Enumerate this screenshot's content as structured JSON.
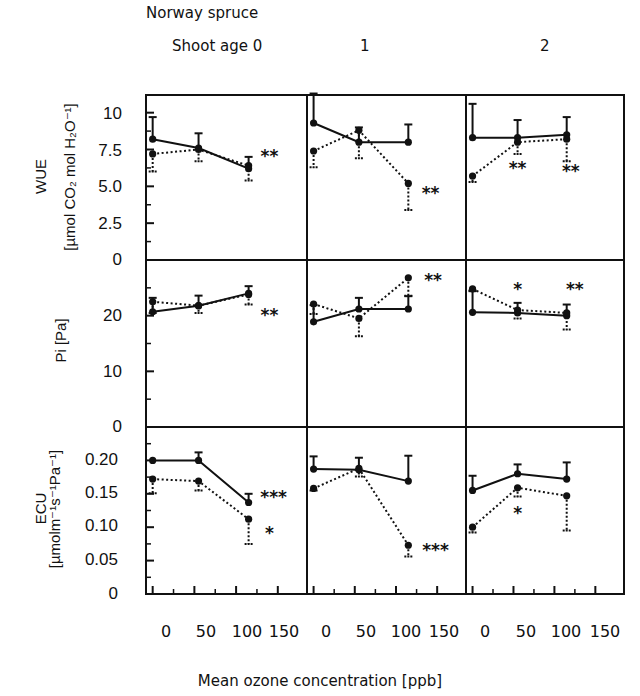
{
  "figure": {
    "species": "Norway spruce",
    "age_labels": [
      "Shoot age 0",
      "1",
      "2"
    ],
    "x_title": "Mean ozone concentration [ppb]",
    "x_tick_labels": [
      "0",
      "50",
      "100",
      "150"
    ],
    "rows": [
      {
        "name": "WUE",
        "ylabel_line1": "WUE",
        "ylabel_line2": "[µmol CO₂ mol H₂O⁻¹]",
        "ticks": [
          "10",
          "7.5",
          "5.0",
          "2.5",
          "0"
        ]
      },
      {
        "name": "Pi",
        "ylabel_line1": "Pi [Pa]",
        "ylabel_line2": "",
        "ticks": [
          "20",
          "10",
          "0"
        ]
      },
      {
        "name": "ECU",
        "ylabel_line1": "ECU",
        "ylabel_line2": "[µmolm⁻¹s⁻¹Pa⁻¹]",
        "ticks": [
          "0.20",
          "0.15",
          "0.10",
          "0.05",
          "0"
        ]
      }
    ]
  },
  "chart_data": {
    "type": "line",
    "title": "Norway spruce",
    "xlabel": "Mean ozone concentration [ppb]",
    "x_ticks": [
      0,
      50,
      100,
      150
    ],
    "xlim": [
      -8,
      185
    ],
    "columns": [
      "Shoot age 0",
      "1",
      "2"
    ],
    "series_style": {
      "control": {
        "line": "solid",
        "errorbar": "up"
      },
      "ozone_treatment": {
        "line": "dotted",
        "errorbar": "down"
      }
    },
    "grid": false,
    "panels": [
      {
        "row": "WUE",
        "col": "Shoot age 0",
        "ylabel": "WUE [µmol CO2 mol H2O-1]",
        "ylim": [
          0,
          11.2
        ],
        "y_ticks": [
          0,
          2.5,
          5.0,
          7.5,
          10
        ],
        "series": [
          {
            "name": "solid",
            "x": [
              0,
              55,
              115
            ],
            "values": [
              8.2,
              7.6,
              6.2
            ],
            "err": [
              1.5,
              1.0,
              0.8
            ]
          },
          {
            "name": "dotted",
            "x": [
              0,
              55,
              115
            ],
            "values": [
              7.2,
              7.5,
              6.4
            ],
            "err": [
              1.2,
              0.8,
              1.0
            ]
          }
        ],
        "annotations": [
          {
            "x": 140,
            "y": 7.0,
            "text": "**"
          }
        ]
      },
      {
        "row": "WUE",
        "col": "1",
        "ylim": [
          0,
          11.2
        ],
        "series": [
          {
            "name": "solid",
            "x": [
              0,
              55,
              115
            ],
            "values": [
              9.3,
              8.0,
              8.0
            ],
            "err": [
              2.0,
              1.0,
              1.2
            ]
          },
          {
            "name": "dotted",
            "x": [
              0,
              55,
              115
            ],
            "values": [
              7.4,
              8.8,
              5.2
            ],
            "err": [
              1.1,
              1.9,
              1.8
            ]
          }
        ],
        "annotations": [
          {
            "x": 142,
            "y": 4.5,
            "text": "**"
          }
        ]
      },
      {
        "row": "WUE",
        "col": "2",
        "ylim": [
          0,
          11.2
        ],
        "series": [
          {
            "name": "solid",
            "x": [
              0,
              55,
              115
            ],
            "values": [
              8.3,
              8.3,
              8.5
            ],
            "err": [
              2.3,
              1.2,
              1.2
            ]
          },
          {
            "name": "dotted",
            "x": [
              0,
              55,
              115
            ],
            "values": [
              5.7,
              8.0,
              8.2
            ],
            "err": [
              0.4,
              0.8,
              1.5
            ]
          }
        ],
        "annotations": [
          {
            "x": 55,
            "y": 6.2,
            "text": "**"
          },
          {
            "x": 120,
            "y": 6.0,
            "text": "**"
          }
        ]
      },
      {
        "row": "Pi",
        "col": "Shoot age 0",
        "ylabel": "Pi [Pa]",
        "ylim": [
          0,
          30
        ],
        "y_ticks": [
          0,
          10,
          20
        ],
        "series": [
          {
            "name": "solid",
            "x": [
              0,
              55,
              115
            ],
            "values": [
              20.7,
              21.8,
              24.0
            ],
            "err": [
              2.5,
              1.8,
              1.3
            ]
          },
          {
            "name": "dotted",
            "x": [
              0,
              55,
              115
            ],
            "values": [
              22.5,
              21.8,
              23.8
            ],
            "err": [
              2.0,
              1.3,
              1.8
            ]
          }
        ],
        "annotations": [
          {
            "x": 140,
            "y": 20.0,
            "text": "**"
          }
        ]
      },
      {
        "row": "Pi",
        "col": "1",
        "ylim": [
          0,
          30
        ],
        "series": [
          {
            "name": "solid",
            "x": [
              0,
              55,
              115
            ],
            "values": [
              18.9,
              21.2,
              21.2
            ],
            "err": [
              3.0,
              2.0,
              2.3
            ]
          },
          {
            "name": "dotted",
            "x": [
              0,
              55,
              115
            ],
            "values": [
              22.1,
              19.5,
              26.8
            ],
            "err": [
              1.8,
              3.2,
              3.2
            ]
          }
        ],
        "annotations": [
          {
            "x": 145,
            "y": 26.2,
            "text": "**"
          }
        ]
      },
      {
        "row": "Pi",
        "col": "2",
        "ylim": [
          0,
          30
        ],
        "series": [
          {
            "name": "solid",
            "x": [
              0,
              55,
              115
            ],
            "values": [
              20.6,
              20.5,
              20.0
            ],
            "err": [
              3.8,
              1.8,
              2.0
            ]
          },
          {
            "name": "dotted",
            "x": [
              0,
              55,
              115
            ],
            "values": [
              24.8,
              21.0,
              20.5
            ],
            "err": [
              0.3,
              1.5,
              3.0
            ]
          }
        ],
        "annotations": [
          {
            "x": 55,
            "y": 24.6,
            "text": "*"
          },
          {
            "x": 125,
            "y": 24.6,
            "text": "**"
          }
        ]
      },
      {
        "row": "ECU",
        "col": "Shoot age 0",
        "ylabel": "ECU [µmolm-1s-1Pa-1]",
        "ylim": [
          0,
          0.25
        ],
        "y_ticks": [
          0,
          0.05,
          0.1,
          0.15,
          0.2
        ],
        "series": [
          {
            "name": "solid",
            "x": [
              0,
              55,
              115
            ],
            "values": [
              0.2,
              0.2,
              0.137
            ],
            "err": [
              0.0,
              0.012,
              0.013
            ]
          },
          {
            "name": "dotted",
            "x": [
              0,
              55,
              115
            ],
            "values": [
              0.172,
              0.169,
              0.112
            ],
            "err": [
              0.021,
              0.014,
              0.037
            ]
          }
        ],
        "annotations": [
          {
            "x": 145,
            "y": 0.143,
            "text": "***"
          },
          {
            "x": 140,
            "y": 0.09,
            "text": "*"
          }
        ]
      },
      {
        "row": "ECU",
        "col": "1",
        "ylim": [
          0,
          0.25
        ],
        "series": [
          {
            "name": "solid",
            "x": [
              0,
              55,
              115
            ],
            "values": [
              0.187,
              0.186,
              0.169
            ],
            "err": [
              0.019,
              0.018,
              0.038
            ]
          },
          {
            "name": "dotted",
            "x": [
              0,
              55,
              115
            ],
            "values": [
              0.158,
              0.188,
              0.073
            ],
            "err": [
              0.003,
              0.012,
              0.017
            ]
          }
        ],
        "annotations": [
          {
            "x": 148,
            "y": 0.065,
            "text": "***"
          }
        ]
      },
      {
        "row": "ECU",
        "col": "2",
        "ylim": [
          0,
          0.25
        ],
        "series": [
          {
            "name": "solid",
            "x": [
              0,
              55,
              115
            ],
            "values": [
              0.155,
              0.18,
              0.172
            ],
            "err": [
              0.022,
              0.014,
              0.025
            ]
          },
          {
            "name": "dotted",
            "x": [
              0,
              55,
              115
            ],
            "values": [
              0.1,
              0.159,
              0.147
            ],
            "err": [
              0.008,
              0.013,
              0.052
            ]
          }
        ],
        "annotations": [
          {
            "x": 55,
            "y": 0.12,
            "text": "*"
          }
        ]
      }
    ]
  },
  "layout": {
    "left": 146,
    "right": 624,
    "col_edges": [
      146,
      307,
      466,
      624
    ],
    "row_edges": [
      95,
      260,
      427,
      594
    ]
  }
}
